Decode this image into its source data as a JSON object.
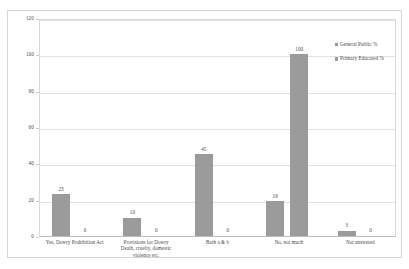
{
  "chart_data": {
    "type": "bar",
    "title": "",
    "xlabel": "",
    "ylabel": "",
    "ylim": [
      0,
      120
    ],
    "yticks": [
      0,
      20,
      40,
      60,
      80,
      100,
      120
    ],
    "grid": true,
    "legend_position": "right",
    "categories": [
      "Yes, Dowry Prohibition Act",
      "Provisions for Dowry Death, cruelty, domestic violence etc.",
      "Both a & b",
      "No, not much",
      "Not answered"
    ],
    "category_lines": [
      [
        "Yes, Dowry Prohibition Act"
      ],
      [
        "Provisions for Dowry",
        "Death, cruelty, domestic",
        "violence etc."
      ],
      [
        "Both a & b"
      ],
      [
        "No, not much"
      ],
      [
        "Not answered"
      ]
    ],
    "series": [
      {
        "name": "General Public %",
        "color": "#9b9b9b",
        "values": [
          23,
          10,
          45,
          19,
          3
        ],
        "labels": [
          "23",
          "10",
          "45",
          "19",
          "3"
        ]
      },
      {
        "name": "Primary Educated %",
        "color": "#9b9b9b",
        "values": [
          0,
          0,
          0,
          100,
          0
        ],
        "labels": [
          "0",
          "0",
          "0",
          "100",
          "0"
        ]
      }
    ]
  },
  "axis": {
    "y_tick_labels": [
      "0",
      "20",
      "40",
      "60",
      "80",
      "100",
      "120"
    ]
  },
  "legend": {
    "items": [
      {
        "label": "General Public %"
      },
      {
        "label": "Primary Educated %"
      }
    ]
  }
}
